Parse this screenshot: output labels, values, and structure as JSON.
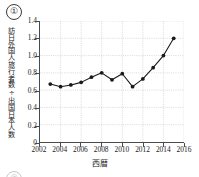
{
  "item": {
    "number": "①",
    "next_number": "②"
  },
  "chart_data": {
    "type": "line",
    "title": "",
    "xlabel": "西暦",
    "ylabel": "訪日外国人旅行者数÷出国日本人数",
    "x": [
      2003,
      2004,
      2005,
      2006,
      2007,
      2008,
      2009,
      2010,
      2011,
      2012,
      2013,
      2014,
      2015
    ],
    "values": [
      0.67,
      0.64,
      0.66,
      0.69,
      0.75,
      0.8,
      0.72,
      0.79,
      0.64,
      0.73,
      0.86,
      1.0,
      1.2
    ],
    "xlim": [
      2002,
      2016
    ],
    "ylim": [
      0,
      1.4
    ],
    "xticks": [
      2002,
      2004,
      2006,
      2008,
      2010,
      2012,
      2014,
      2016
    ],
    "xticklabels": [
      "2002",
      "2004",
      "2006",
      "2008",
      "2010",
      "2012",
      "2014",
      "2016"
    ],
    "yticks": [
      0,
      0.2,
      0.4,
      0.6,
      0.8,
      1.0,
      1.2,
      1.4
    ],
    "yticklabels": [
      "0",
      "0.2",
      "0.4",
      "0.6",
      "0.8",
      "1.0",
      "1.2",
      "1.4"
    ],
    "grid": true,
    "legend": null,
    "marker": "circle",
    "line_color": "#1a1a1a",
    "marker_color": "#1a1a1a",
    "grid_color": "#c9c9c9"
  }
}
